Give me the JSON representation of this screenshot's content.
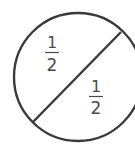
{
  "diagram": {
    "stroke_color": "#3a3a3a",
    "text_color": "#4a4a4a",
    "parts": [
      {
        "label": "upper-left half",
        "numerator": "1",
        "denominator": "2"
      },
      {
        "label": "lower-right half",
        "numerator": "1",
        "denominator": "2"
      }
    ]
  }
}
